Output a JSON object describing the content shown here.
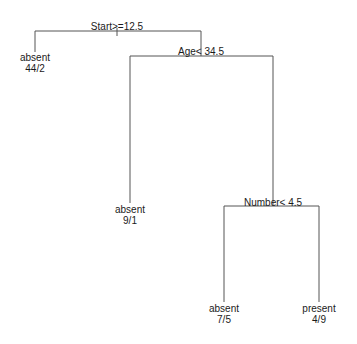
{
  "tree": {
    "type": "classification-tree",
    "root": {
      "split": "Start>=12.5",
      "left": {
        "leaf": true,
        "class": "absent",
        "counts": "44/2"
      },
      "right": {
        "split": "Age< 34.5",
        "left": {
          "leaf": true,
          "class": "absent",
          "counts": "9/1"
        },
        "right": {
          "split": "Number< 4.5",
          "left": {
            "leaf": true,
            "class": "absent",
            "counts": "7/5"
          },
          "right": {
            "leaf": true,
            "class": "present",
            "counts": "4/9"
          }
        }
      }
    }
  },
  "labels": {
    "root_split": "Start>=12.5",
    "age_split": "Age< 34.5",
    "number_split": "Number< 4.5",
    "leaf1_class": "absent",
    "leaf1_counts": "44/2",
    "leaf2_class": "absent",
    "leaf2_counts": "9/1",
    "leaf3_class": "absent",
    "leaf3_counts": "7/5",
    "leaf4_class": "present",
    "leaf4_counts": "4/9"
  },
  "colors": {
    "edge": "#555555",
    "text": "#1a1a1a",
    "background": "#ffffff"
  }
}
